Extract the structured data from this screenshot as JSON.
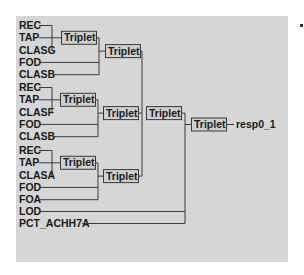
{
  "diagram": {
    "node_label": "Triplet",
    "output_label": "resp0_1",
    "groups": [
      {
        "inputs": [
          "REC",
          "TAP",
          "CLASG",
          "FOD",
          "CLASB"
        ]
      },
      {
        "inputs": [
          "REC",
          "TAP",
          "CLASF",
          "FOD",
          "CLASB"
        ]
      },
      {
        "inputs": [
          "REC",
          "TAP",
          "CLASA",
          "FOD",
          "FOA"
        ]
      }
    ],
    "extra_inputs": [
      "LOD",
      "PCT_ACHH7A"
    ],
    "colors": {
      "background": "#d6d6d6",
      "line": "#3a3a3a",
      "text": "#1a1a1a"
    }
  }
}
